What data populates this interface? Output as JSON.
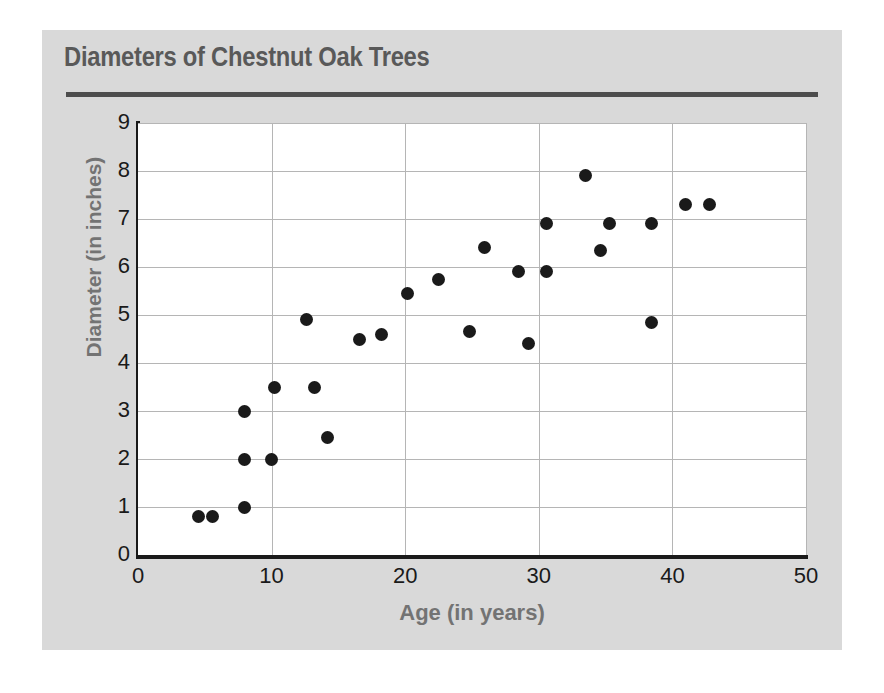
{
  "chart_data": {
    "type": "scatter",
    "title": "Diameters of Chestnut Oak Trees",
    "xlabel": "Age (in years)",
    "ylabel": "Diameter (in inches)",
    "xlim": [
      0,
      50
    ],
    "ylim": [
      0,
      9
    ],
    "xticks": [
      0,
      10,
      20,
      30,
      40,
      50
    ],
    "yticks": [
      0,
      1,
      2,
      3,
      4,
      5,
      6,
      7,
      8,
      9
    ],
    "xtick_labels": [
      "0",
      "10",
      "20",
      "30",
      "40",
      "50"
    ],
    "ytick_labels": [
      "0",
      "1",
      "2",
      "3",
      "4",
      "5",
      "6",
      "7",
      "8",
      "9"
    ],
    "grid": true,
    "grid_color": "#b5b5b5",
    "legend": null,
    "marker": "circle",
    "marker_color": "#1a1a1a",
    "points": [
      {
        "x": 4.5,
        "y": 0.8
      },
      {
        "x": 5.6,
        "y": 0.8
      },
      {
        "x": 8.0,
        "y": 1.0
      },
      {
        "x": 8.0,
        "y": 2.0
      },
      {
        "x": 8.0,
        "y": 3.0
      },
      {
        "x": 10.0,
        "y": 2.0
      },
      {
        "x": 10.2,
        "y": 3.5
      },
      {
        "x": 12.6,
        "y": 4.9
      },
      {
        "x": 13.2,
        "y": 3.5
      },
      {
        "x": 14.2,
        "y": 2.45
      },
      {
        "x": 16.6,
        "y": 4.5
      },
      {
        "x": 18.2,
        "y": 4.6
      },
      {
        "x": 20.2,
        "y": 5.45
      },
      {
        "x": 22.5,
        "y": 5.75
      },
      {
        "x": 24.8,
        "y": 4.65
      },
      {
        "x": 25.9,
        "y": 6.4
      },
      {
        "x": 28.5,
        "y": 5.9
      },
      {
        "x": 29.2,
        "y": 4.4
      },
      {
        "x": 30.6,
        "y": 6.9
      },
      {
        "x": 30.6,
        "y": 5.9
      },
      {
        "x": 33.5,
        "y": 7.9
      },
      {
        "x": 34.6,
        "y": 6.35
      },
      {
        "x": 35.3,
        "y": 6.9
      },
      {
        "x": 38.4,
        "y": 6.9
      },
      {
        "x": 38.4,
        "y": 4.85
      },
      {
        "x": 41.0,
        "y": 7.3
      },
      {
        "x": 42.8,
        "y": 7.3
      }
    ]
  },
  "colors": {
    "panel_background": "#d9d9d9",
    "plot_background": "#ffffff",
    "title_text": "#595959",
    "axis_label_text": "#737373",
    "tick_text": "#1a1a1a",
    "axis_line": "#1a1a1a",
    "grid_line": "#b5b5b5",
    "marker": "#1a1a1a",
    "rule": "#4d4d4d"
  }
}
